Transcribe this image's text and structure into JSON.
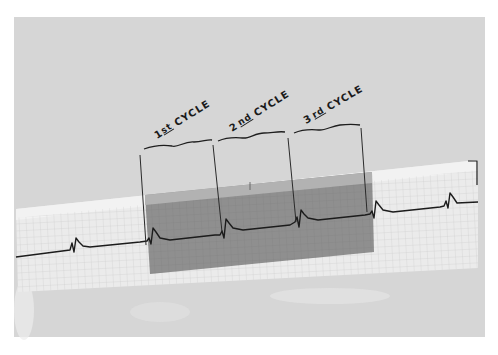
{
  "figure": {
    "cycle_labels": [
      {
        "num": "1",
        "suffix": "st",
        "word": "CYCLE"
      },
      {
        "num": "2",
        "suffix": "nd",
        "word": "CYCLE"
      },
      {
        "num": "3",
        "suffix": "rd",
        "word": "CYCLE"
      }
    ],
    "colors": {
      "backdrop": "#d4d4d4",
      "strip": "#eaeaea",
      "shaded": "#8e8e8e",
      "shaded_top": "#b0b0b0",
      "trace": "#1e1e1e",
      "grid": "#c8c8c8"
    }
  }
}
